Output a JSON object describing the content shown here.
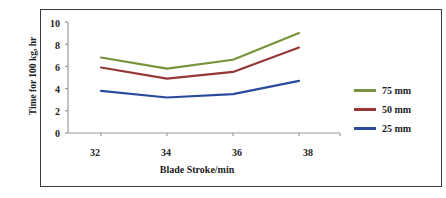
{
  "chart_data": {
    "type": "line",
    "title": "",
    "xlabel": "Blade Stroke/min",
    "ylabel": "Time for 100 kg, hr",
    "x": [
      32,
      34,
      36,
      38
    ],
    "xticklabels": [
      "32",
      "34",
      "36",
      "38"
    ],
    "yticklabels": [
      "0",
      "2",
      "4",
      "6",
      "8",
      "10"
    ],
    "xlim": [
      31,
      39
    ],
    "ylim": [
      0,
      10
    ],
    "grid": false,
    "legend_position": "right",
    "series": [
      {
        "name": "75 mm",
        "color": "#77933C",
        "values": [
          6.8,
          5.8,
          6.6,
          9.0
        ]
      },
      {
        "name": "50 mm",
        "color": "#953735",
        "values": [
          5.9,
          4.9,
          5.5,
          7.7
        ]
      },
      {
        "name": "25 mm",
        "color": "#2A4B9B",
        "values": [
          3.8,
          3.2,
          3.5,
          4.7
        ]
      }
    ]
  },
  "axes": {
    "y_ticks": [
      {
        "label": "10"
      },
      {
        "label": "8"
      },
      {
        "label": "6"
      },
      {
        "label": "4"
      },
      {
        "label": "2"
      },
      {
        "label": "0"
      }
    ],
    "x_ticks": [
      {
        "label": "32"
      },
      {
        "label": "34"
      },
      {
        "label": "36"
      },
      {
        "label": "38"
      }
    ],
    "y_title": "Time for 100 kg, hr",
    "x_title": "Blade Stroke/min"
  },
  "legend": {
    "items": [
      {
        "label": "75 mm",
        "color": "#77933C"
      },
      {
        "label": "50 mm",
        "color": "#953735"
      },
      {
        "label": "25 mm",
        "color": "#2A4B9B"
      }
    ]
  },
  "colors": {
    "series_75mm": "#77933C",
    "series_50mm": "#953735",
    "series_25mm": "#2A4B9B",
    "axis": "#9a9a9a",
    "border": "#3a3a3a",
    "text": "#1d1d1d",
    "background": "#ffffff"
  }
}
